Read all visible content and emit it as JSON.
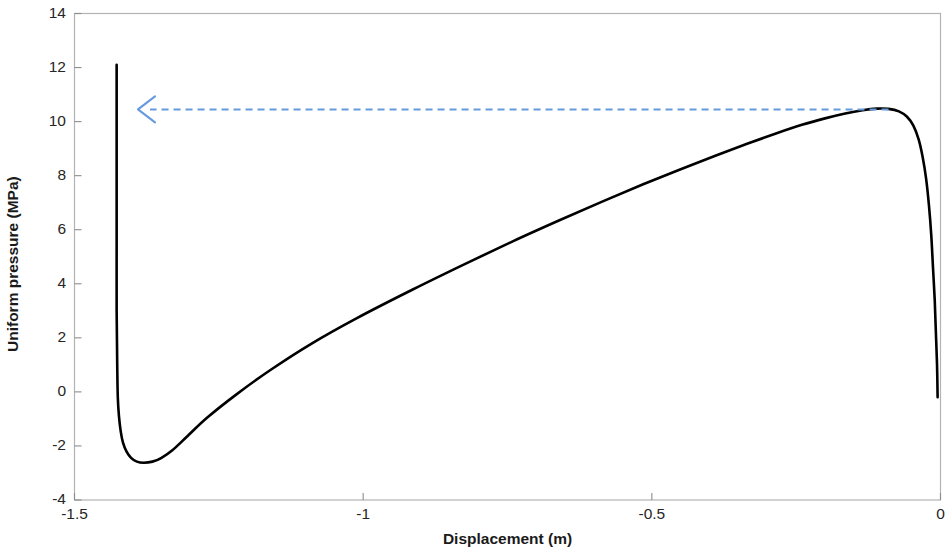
{
  "chart_data": {
    "type": "line",
    "title": "",
    "xlabel": "Displacement (m)",
    "ylabel": "Uniform pressure (MPa)",
    "xlim": [
      -1.5,
      0
    ],
    "ylim": [
      -4,
      14
    ],
    "xticks": [
      -1.5,
      -1,
      -0.5,
      0
    ],
    "xtick_labels": [
      "-1.5",
      "-1",
      "-0.5",
      "0"
    ],
    "yticks": [
      -4,
      -2,
      0,
      2,
      4,
      6,
      8,
      10,
      12,
      14
    ],
    "ytick_labels": [
      "-4",
      "-2",
      "0",
      "2",
      "4",
      "6",
      "8",
      "10",
      "12",
      "14"
    ],
    "grid": false,
    "legend": null,
    "box": true,
    "series": [
      {
        "name": "equilibrium-path",
        "color": "#000000",
        "linewidth": 2.6,
        "linestyle": "solid",
        "points": [
          [
            -0.005,
            -0.2
          ],
          [
            -0.006,
            1.0
          ],
          [
            -0.008,
            2.2
          ],
          [
            -0.01,
            3.4
          ],
          [
            -0.013,
            4.6
          ],
          [
            -0.016,
            5.8
          ],
          [
            -0.02,
            6.9
          ],
          [
            -0.025,
            7.9
          ],
          [
            -0.031,
            8.7
          ],
          [
            -0.038,
            9.35
          ],
          [
            -0.047,
            9.85
          ],
          [
            -0.058,
            10.18
          ],
          [
            -0.072,
            10.38
          ],
          [
            -0.09,
            10.47
          ],
          [
            -0.11,
            10.48
          ],
          [
            -0.135,
            10.42
          ],
          [
            -0.165,
            10.3
          ],
          [
            -0.2,
            10.12
          ],
          [
            -0.24,
            9.88
          ],
          [
            -0.285,
            9.56
          ],
          [
            -0.335,
            9.18
          ],
          [
            -0.39,
            8.74
          ],
          [
            -0.45,
            8.24
          ],
          [
            -0.515,
            7.68
          ],
          [
            -0.585,
            7.05
          ],
          [
            -0.66,
            6.35
          ],
          [
            -0.74,
            5.58
          ],
          [
            -0.825,
            4.72
          ],
          [
            -0.915,
            3.78
          ],
          [
            -1.01,
            2.74
          ],
          [
            -1.09,
            1.78
          ],
          [
            -1.16,
            0.82
          ],
          [
            -1.22,
            -0.1
          ],
          [
            -1.27,
            -0.95
          ],
          [
            -1.305,
            -1.65
          ],
          [
            -1.33,
            -2.15
          ],
          [
            -1.35,
            -2.45
          ],
          [
            -1.365,
            -2.58
          ],
          [
            -1.38,
            -2.62
          ],
          [
            -1.392,
            -2.58
          ],
          [
            -1.402,
            -2.44
          ],
          [
            -1.41,
            -2.2
          ],
          [
            -1.416,
            -1.88
          ],
          [
            -1.42,
            -1.45
          ],
          [
            -1.423,
            -0.9
          ],
          [
            -1.425,
            -0.2
          ],
          [
            -1.426,
            1.0
          ],
          [
            -1.427,
            3.0
          ],
          [
            -1.427,
            5.5
          ],
          [
            -1.427,
            8.0
          ],
          [
            -1.427,
            10.0
          ],
          [
            -1.427,
            12.1
          ]
        ]
      }
    ],
    "annotations": [
      {
        "name": "peak-pressure-arrow",
        "type": "arrow",
        "style": "dashed",
        "color": "#6699DD",
        "from": [
          -0.09,
          10.45
        ],
        "to": [
          -1.39,
          10.45
        ],
        "label": ""
      }
    ]
  }
}
